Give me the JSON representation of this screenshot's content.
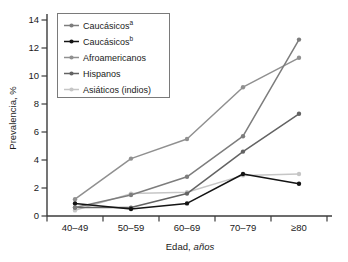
{
  "figure": {
    "ylabel": "Prevalencia, %",
    "xlabel_prefix": "Edad,",
    "xlabel_word": "años"
  },
  "chart_data": {
    "type": "line",
    "title": "",
    "xlabel": "Edad, años",
    "ylabel": "Prevalencia, %",
    "categories": [
      "40–49",
      "50–59",
      "60–69",
      "70–79",
      "≥80"
    ],
    "ylim": [
      0,
      14
    ],
    "yticks": [
      0,
      2,
      4,
      6,
      8,
      10,
      12,
      14
    ],
    "grid": false,
    "legend_position": "top-left",
    "axis_color": "#3b3b3b",
    "text_color": "#1a1a1a",
    "legend_border_color": "#7a7a7a",
    "series": [
      {
        "name": "Caucásicos",
        "sup": "a",
        "color": "#7d7d7d",
        "values": [
          0.6,
          1.5,
          2.8,
          5.7,
          12.6
        ]
      },
      {
        "name": "Caucásicos",
        "sup": "b",
        "color": "#141414",
        "values": [
          0.9,
          0.5,
          0.9,
          3.0,
          2.3
        ]
      },
      {
        "name": "Afroamericanos",
        "sup": "",
        "color": "#909090",
        "values": [
          1.2,
          4.1,
          5.5,
          9.2,
          11.3
        ]
      },
      {
        "name": "Hispanos",
        "sup": "",
        "color": "#636363",
        "values": [
          0.6,
          0.6,
          1.6,
          4.6,
          7.3
        ]
      },
      {
        "name": "Asiáticos (indios)",
        "sup": "",
        "color": "#c6c6c6",
        "values": [
          0.4,
          1.6,
          1.7,
          2.9,
          3.0
        ]
      }
    ]
  }
}
